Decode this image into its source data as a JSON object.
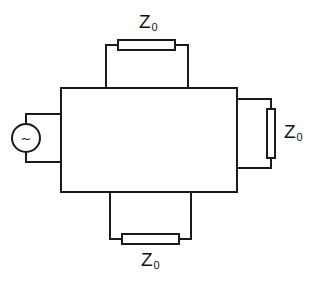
{
  "diagram": {
    "type": "circuit-schematic",
    "stroke_color": "#1a1a1a",
    "source": {
      "symbol": "~",
      "kind": "ac-voltage-source"
    },
    "labels": {
      "top": {
        "main": "Z",
        "sub": "0"
      },
      "right": {
        "main": "Z",
        "sub": "0"
      },
      "bottom": {
        "main": "Z",
        "sub": "0"
      }
    }
  }
}
